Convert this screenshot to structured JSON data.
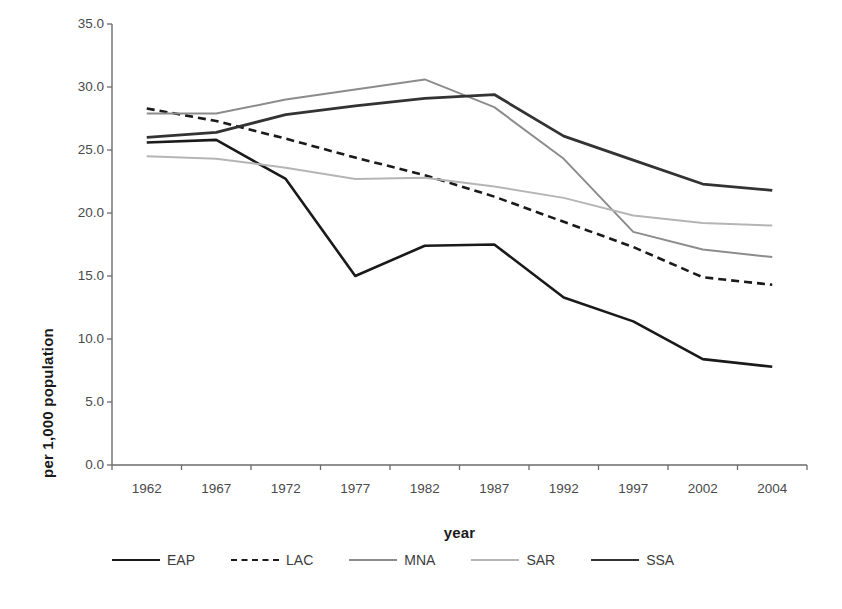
{
  "chart_data": {
    "type": "line",
    "title": "",
    "xlabel": "year",
    "ylabel": "per 1,000 population",
    "categories": [
      "1962",
      "1967",
      "1972",
      "1977",
      "1982",
      "1987",
      "1992",
      "1997",
      "2002",
      "2004"
    ],
    "ylim": [
      0.0,
      35.0
    ],
    "ytick_labels": [
      "0.0",
      "5.0",
      "10.0",
      "15.0",
      "20.0",
      "25.0",
      "30.0",
      "35.0"
    ],
    "ytick_values": [
      0.0,
      5.0,
      10.0,
      15.0,
      20.0,
      25.0,
      30.0,
      35.0
    ],
    "grid": false,
    "legend_position": "bottom",
    "series": [
      {
        "name": "EAP",
        "style": "solid",
        "color": "#1a1a1a",
        "width": 2.6,
        "values": [
          25.6,
          25.8,
          22.7,
          15.0,
          17.4,
          17.5,
          13.3,
          11.4,
          8.4,
          7.8
        ]
      },
      {
        "name": "LAC",
        "style": "dashed",
        "color": "#1a1a1a",
        "width": 2.6,
        "values": [
          28.3,
          27.3,
          25.9,
          24.4,
          23.0,
          21.3,
          19.3,
          17.3,
          14.9,
          14.3
        ]
      },
      {
        "name": "MNA",
        "style": "solid",
        "color": "#8c8c8c",
        "width": 2.0,
        "values": [
          27.9,
          27.9,
          29.0,
          29.8,
          30.6,
          28.4,
          24.3,
          18.5,
          17.1,
          16.5
        ]
      },
      {
        "name": "SAR",
        "style": "solid",
        "color": "#b5b5b5",
        "width": 2.0,
        "values": [
          24.5,
          24.3,
          23.6,
          22.7,
          22.8,
          22.1,
          21.2,
          19.8,
          19.2,
          19.0
        ]
      },
      {
        "name": "SSA",
        "style": "solid",
        "color": "#333333",
        "width": 2.8,
        "values": [
          26.0,
          26.4,
          27.8,
          28.5,
          29.1,
          29.4,
          26.1,
          24.2,
          22.3,
          21.8
        ]
      }
    ]
  }
}
